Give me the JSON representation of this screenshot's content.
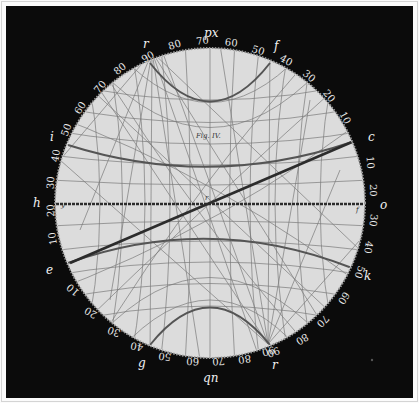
{
  "figure": {
    "title": "Fig. IV.",
    "type": "stereographic projection plate",
    "colors": {
      "background": "#0b0b0b",
      "disc": "#dedede",
      "grid": "#6a6a6a",
      "heavy_line": "#3a3a3a",
      "labels": "#e9e9e9"
    }
  },
  "pole_labels": {
    "top": "px",
    "bottom": "qn",
    "left": "h",
    "right": "o",
    "upper_left_r": "r",
    "lower_right_r": "r",
    "f": "f",
    "i": "i",
    "c": "c",
    "e": "e",
    "k": "k",
    "g": "g"
  },
  "inner_labels": {
    "left_end": "y",
    "right_end": "f",
    "centre": "r"
  },
  "scales": {
    "top_arc": [
      "90",
      "80",
      "70",
      "60",
      "50",
      "40",
      "30",
      "20",
      "10"
    ],
    "left_arc": [
      "80",
      "70",
      "60",
      "50",
      "40",
      "30",
      "20",
      "10"
    ],
    "right_arc": [
      "10",
      "20",
      "30",
      "40",
      "50",
      "60",
      "70",
      "80",
      "90"
    ],
    "bottom_arc": [
      "10",
      "20",
      "30",
      "40",
      "50",
      "60",
      "70",
      "80",
      "90"
    ]
  }
}
